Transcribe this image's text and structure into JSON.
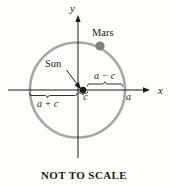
{
  "figure": {
    "caption": "NOT TO SCALE",
    "axes": {
      "x_label": "x",
      "y_label": "y"
    },
    "bodies": {
      "mars_label": "Mars",
      "sun_label": "Sun"
    },
    "measurements": {
      "sun_to_right_vertex": "a − c",
      "left_vertex_to_sun": "a + c",
      "center_to_sun": "c",
      "semi_major_axis": "a"
    },
    "colors": {
      "background": "#fdfdfa",
      "ink": "#1a1a1a",
      "orbit": "#a6a6a6",
      "mars": "#7f7f7f"
    }
  }
}
